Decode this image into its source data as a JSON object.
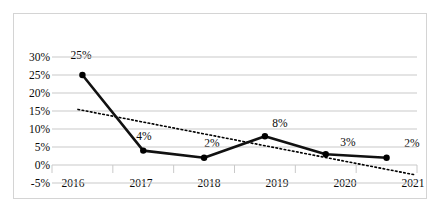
{
  "chart_data": {
    "type": "line",
    "title": "",
    "subtitle": "",
    "xlabel": "",
    "ylabel": "",
    "categories": [
      "2016",
      "2017",
      "2018",
      "2019",
      "2020",
      "2021"
    ],
    "ylim": [
      -5,
      30
    ],
    "y_ticks": [
      "-5%",
      "0%",
      "5%",
      "10%",
      "15%",
      "20%",
      "25%",
      "30%"
    ],
    "y_tick_values": [
      -5,
      0,
      5,
      10,
      15,
      20,
      25,
      30
    ],
    "grid": true,
    "legend": "none",
    "series": [
      {
        "name": "Growth rate",
        "style": "solid",
        "marker": "circle",
        "color": "#000000",
        "values": [
          25,
          4,
          2,
          8,
          3,
          2
        ],
        "data_labels": [
          "25%",
          "4%",
          "2%",
          "8%",
          "3%",
          "2%"
        ]
      },
      {
        "name": "Trendline",
        "style": "dotted",
        "marker": "none",
        "color": "#000000",
        "values": [
          15.2,
          11.6,
          8.0,
          4.6,
          1.6,
          -1.2
        ],
        "data_labels": []
      }
    ]
  },
  "axis": {
    "y_labels": [
      "30%",
      "25%",
      "20%",
      "15%",
      "10%",
      "5%",
      "0%",
      "-5%"
    ],
    "x_labels": [
      "2016",
      "2017",
      "2018",
      "2019",
      "2020",
      "2021"
    ]
  },
  "labels": {
    "points": [
      "25%",
      "4%",
      "2%",
      "8%",
      "3%",
      "2%"
    ]
  },
  "colors": {
    "series_line": "#000000",
    "trendline": "#000000",
    "gridline": "#c9c9c9",
    "frame_border": "#d4d4d4",
    "text": "#0a0a0a",
    "background": "#ffffff"
  }
}
